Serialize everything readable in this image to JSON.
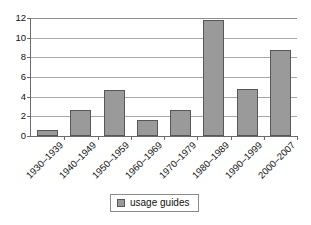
{
  "chart_data": {
    "type": "bar",
    "title": "",
    "xlabel": "",
    "ylabel": "",
    "categories": [
      "1930–1939",
      "1940–1949",
      "1950–1959",
      "1960–1969",
      "1970–1979",
      "1980–1989",
      "1990–1999",
      "2000–2007"
    ],
    "series": [
      {
        "name": "usage guides",
        "values": [
          0.6,
          2.6,
          4.7,
          1.65,
          2.65,
          11.8,
          4.8,
          8.7
        ]
      }
    ],
    "ylim": [
      0,
      12
    ],
    "yticks": [
      0,
      2,
      4,
      6,
      8,
      10,
      12
    ],
    "ytick_labels": [
      "0",
      "2",
      "4",
      "6",
      "8",
      "10",
      "12"
    ],
    "grid": true,
    "grid_axis": "y",
    "legend": {
      "position": "bottom-center",
      "entries": [
        {
          "label": "usage guides",
          "color": "#9a9a9a"
        }
      ]
    },
    "colors": {
      "bar_fill": "#9a9a9a",
      "bar_border": "#575757",
      "gridline": "#a8a8a8",
      "axis": "#6b6b6b",
      "background": "#ffffff",
      "text": "#111111"
    }
  }
}
